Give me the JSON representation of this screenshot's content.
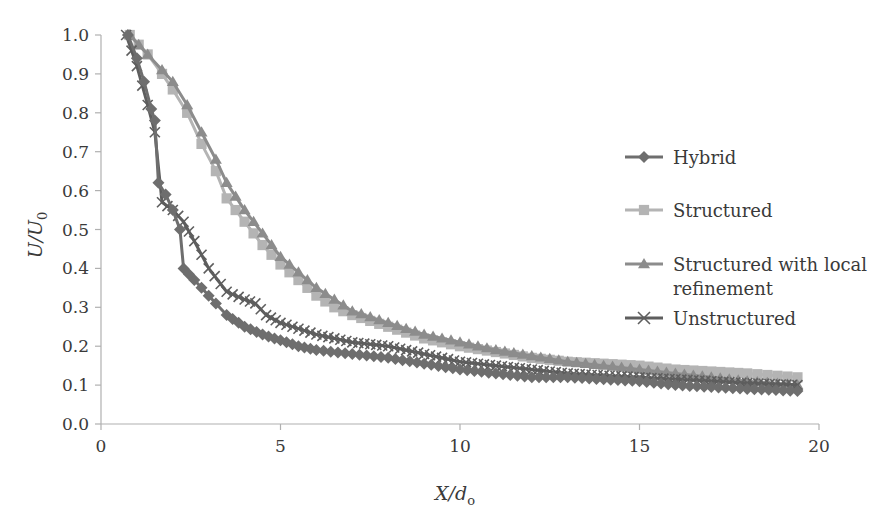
{
  "chart_data": {
    "type": "line",
    "title": "",
    "xlabel": "X/d₀",
    "ylabel": "U/U₀",
    "xlabel_parts": {
      "main": "X/d",
      "sub": "o"
    },
    "ylabel_parts": {
      "main": "U/U",
      "sub": "0"
    },
    "xlim": [
      0,
      20
    ],
    "ylim": [
      0.0,
      1.0
    ],
    "x_ticks": [
      0,
      5,
      10,
      15,
      20
    ],
    "x_tick_labels": [
      "0",
      "5",
      "10",
      "15",
      "20"
    ],
    "y_ticks": [
      0.0,
      0.1,
      0.2,
      0.3,
      0.4,
      0.5,
      0.6,
      0.7,
      0.8,
      0.9,
      1.0
    ],
    "y_tick_labels": [
      "0.0",
      "0.1",
      "0.2",
      "0.3",
      "0.4",
      "0.5",
      "0.6",
      "0.7",
      "0.8",
      "0.9",
      "1.0"
    ],
    "grid": false,
    "legend_position": "right",
    "series": [
      {
        "name": "Hybrid",
        "marker": "diamond",
        "color": "#6e6e6e",
        "x": [
          0.75,
          1.0,
          1.2,
          1.4,
          1.5,
          1.6,
          1.8,
          2.0,
          2.2,
          2.3,
          2.6,
          2.8,
          3.2,
          3.5,
          4.0,
          4.5,
          5.0,
          5.5,
          6.0,
          7.0,
          8.0,
          9.0,
          10.0,
          11.0,
          12.0,
          13.0,
          14.0,
          15.0,
          16.0,
          17.0,
          18.0,
          19.4
        ],
        "y": [
          1.0,
          0.94,
          0.88,
          0.81,
          0.78,
          0.62,
          0.59,
          0.55,
          0.5,
          0.4,
          0.37,
          0.35,
          0.31,
          0.28,
          0.25,
          0.23,
          0.215,
          0.2,
          0.19,
          0.18,
          0.17,
          0.155,
          0.14,
          0.13,
          0.12,
          0.12,
          0.115,
          0.11,
          0.1,
          0.095,
          0.09,
          0.085
        ]
      },
      {
        "name": "Structured",
        "marker": "square",
        "color": "#b4b4b4",
        "x": [
          0.8,
          1.3,
          1.7,
          2.0,
          2.4,
          2.8,
          3.2,
          3.5,
          4.0,
          4.5,
          5.0,
          5.5,
          6.0,
          6.5,
          7.0,
          8.0,
          9.0,
          10.0,
          11.0,
          12.0,
          13.0,
          14.0,
          15.0,
          16.0,
          17.0,
          18.0,
          19.4
        ],
        "y": [
          1.0,
          0.95,
          0.9,
          0.86,
          0.8,
          0.72,
          0.65,
          0.58,
          0.52,
          0.46,
          0.41,
          0.37,
          0.33,
          0.3,
          0.28,
          0.25,
          0.22,
          0.2,
          0.185,
          0.17,
          0.16,
          0.155,
          0.15,
          0.14,
          0.135,
          0.13,
          0.12
        ]
      },
      {
        "name": "Structured with local refinement",
        "marker": "triangle",
        "color": "#8c8c8c",
        "x": [
          0.8,
          1.3,
          1.7,
          2.0,
          2.4,
          2.8,
          3.2,
          3.5,
          4.0,
          4.5,
          5.0,
          5.5,
          6.0,
          6.5,
          7.0,
          8.0,
          9.0,
          10.0,
          11.0,
          12.0,
          13.0,
          14.0,
          15.0,
          16.0,
          17.0,
          18.0,
          19.4
        ],
        "y": [
          1.0,
          0.95,
          0.91,
          0.88,
          0.82,
          0.75,
          0.68,
          0.62,
          0.55,
          0.49,
          0.43,
          0.39,
          0.35,
          0.32,
          0.29,
          0.26,
          0.23,
          0.21,
          0.19,
          0.175,
          0.16,
          0.15,
          0.14,
          0.13,
          0.12,
          0.11,
          0.1
        ]
      },
      {
        "name": "Unstructured",
        "marker": "x",
        "color": "#5e5e5e",
        "x": [
          0.7,
          1.0,
          1.3,
          1.5,
          1.7,
          2.0,
          2.3,
          2.6,
          3.0,
          3.5,
          4.0,
          4.3,
          4.6,
          5.0,
          5.5,
          6.0,
          7.0,
          8.0,
          9.0,
          10.0,
          11.0,
          12.0,
          13.0,
          14.0,
          15.0,
          16.0,
          17.0,
          18.0,
          19.4
        ],
        "y": [
          1.0,
          0.92,
          0.82,
          0.75,
          0.57,
          0.55,
          0.52,
          0.47,
          0.4,
          0.34,
          0.32,
          0.31,
          0.28,
          0.26,
          0.245,
          0.23,
          0.21,
          0.2,
          0.18,
          0.16,
          0.15,
          0.14,
          0.13,
          0.125,
          0.12,
          0.115,
          0.11,
          0.105,
          0.1
        ]
      }
    ]
  },
  "legend": {
    "items": [
      {
        "label_lines": [
          "Hybrid"
        ],
        "marker": "diamond",
        "color": "#6e6e6e"
      },
      {
        "label_lines": [
          "Structured"
        ],
        "marker": "square",
        "color": "#b4b4b4"
      },
      {
        "label_lines": [
          "Structured with local",
          "refinement"
        ],
        "marker": "triangle",
        "color": "#8c8c8c"
      },
      {
        "label_lines": [
          "Unstructured"
        ],
        "marker": "x",
        "color": "#5e5e5e"
      }
    ]
  },
  "colors": {
    "axis": "#b0b0b0",
    "text": "#3a3a3a",
    "background": "#ffffff"
  }
}
